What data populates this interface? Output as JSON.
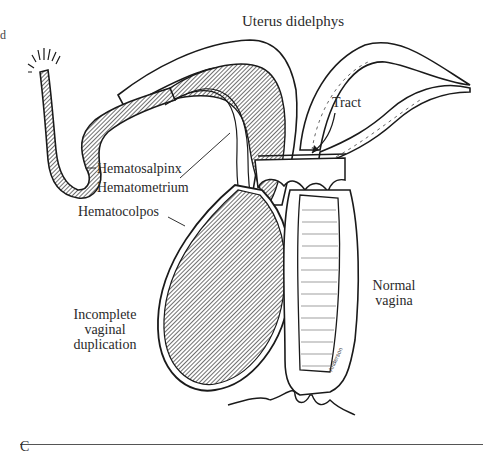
{
  "figure": {
    "panel_letter": "C",
    "title": "Uterus didelphys",
    "edge_fragment_top": "d",
    "labels": {
      "tract": "Tract",
      "hematosalpinx": "Hematosalpinx",
      "hematometrium": "Hematometrium",
      "hematocolpos": "Hematocolpos",
      "incomplete_line1": "Incomplete",
      "incomplete_line2": "vaginal",
      "incomplete_line3": "duplication",
      "normal_line1": "Normal",
      "normal_line2": "vagina"
    },
    "colors": {
      "ink": "#1a1a1a",
      "background": "#ffffff"
    }
  }
}
